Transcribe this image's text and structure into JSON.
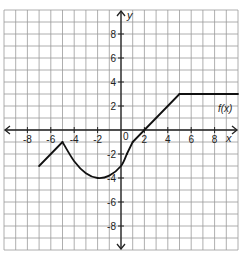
{
  "chart_data": {
    "type": "line",
    "title": "",
    "xlabel": "x",
    "ylabel": "y",
    "function_label": "f(x)",
    "xlim": [
      -10,
      10
    ],
    "ylim": [
      -10,
      10
    ],
    "grid": true,
    "grid_step": 1,
    "x_tick_labels": [
      "-8",
      "-6",
      "-4",
      "-2",
      "2",
      "4",
      "6",
      "8"
    ],
    "x_ticks": [
      -8,
      -6,
      -4,
      -2,
      2,
      4,
      6,
      8
    ],
    "y_tick_labels": [
      "8",
      "6",
      "4",
      "2",
      "-2",
      "-4",
      "-6",
      "-8"
    ],
    "y_ticks": [
      8,
      6,
      4,
      2,
      -2,
      -4,
      -6,
      -8
    ],
    "origin_label": "0",
    "series": [
      {
        "name": "f(x)",
        "segments": [
          {
            "kind": "line",
            "points": [
              [
                -7,
                -3
              ],
              [
                -5,
                -1
              ]
            ]
          },
          {
            "kind": "curve",
            "points": [
              [
                -5,
                -1
              ],
              [
                -4,
                -2.6
              ],
              [
                -3,
                -3.6
              ],
              [
                -2,
                -4
              ],
              [
                -1,
                -3.8
              ],
              [
                0,
                -3
              ],
              [
                0.5,
                -2
              ]
            ]
          },
          {
            "kind": "line",
            "points": [
              [
                0.5,
                -2
              ],
              [
                1,
                -1
              ]
            ]
          },
          {
            "kind": "line",
            "points": [
              [
                1,
                -1
              ],
              [
                5,
                3
              ]
            ]
          },
          {
            "kind": "line",
            "points": [
              [
                5,
                3
              ],
              [
                10,
                3
              ]
            ]
          }
        ],
        "key_points": [
          [
            -7,
            -3
          ],
          [
            -5,
            -1
          ],
          [
            -2,
            -4
          ],
          [
            0,
            -3
          ],
          [
            1,
            -1
          ],
          [
            2,
            0
          ],
          [
            5,
            3
          ],
          [
            10,
            3
          ]
        ]
      }
    ],
    "colors": {
      "grid": "#9a9a9a",
      "axis": "#222222",
      "curve": "#111111"
    }
  }
}
